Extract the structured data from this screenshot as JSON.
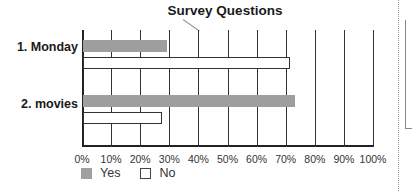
{
  "chart_data": {
    "type": "bar",
    "orientation": "horizontal",
    "title": "Survey Questions",
    "categories": [
      "1. Monday",
      "2. movies"
    ],
    "series": [
      {
        "name": "Yes",
        "values": [
          29,
          73
        ],
        "color": "#9e9e9e"
      },
      {
        "name": "No",
        "values": [
          71,
          27
        ],
        "color": "#ffffff"
      }
    ],
    "xlabel": "",
    "ylabel": "",
    "xlim": [
      0,
      100
    ],
    "x_ticks": [
      "0%",
      "10%",
      "20%",
      "30%",
      "40%",
      "50%",
      "60%",
      "70%",
      "80%",
      "90%",
      "100%"
    ],
    "grid": true,
    "legend_position": "bottom"
  },
  "title": "Survey Questions",
  "categories": [
    "1. Monday",
    "2. movies"
  ],
  "ticks": [
    "0%",
    "10%",
    "20%",
    "30%",
    "40%",
    "50%",
    "60%",
    "70%",
    "80%",
    "90%",
    "100%"
  ],
  "legend": {
    "yes": "Yes",
    "no": "No"
  }
}
